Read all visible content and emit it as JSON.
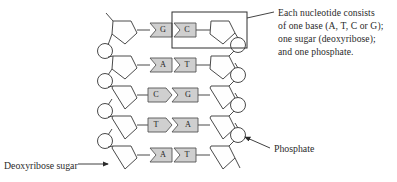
{
  "figure": {
    "type": "dna-structure-diagram",
    "background_color": "#ffffff",
    "line_color": "#3a3a3a",
    "base_fill_color": "#cfcfcf",
    "text_color": "#2a2a2a"
  },
  "callout": {
    "lines": [
      "Each nucleotide consists",
      "of one base (A, T, C or G);",
      "one sugar (deoxyribose);",
      "and one phosphate."
    ]
  },
  "labels": {
    "deoxyribose_sugar": "Deoxyribose sugar",
    "phosphate": "Phosphate"
  },
  "base_pairs": [
    {
      "left": "G",
      "right": "C",
      "left_shape": "notch-right",
      "right_shape": "point-left"
    },
    {
      "left": "A",
      "right": "T",
      "left_shape": "notch-right",
      "right_shape": "point-left"
    },
    {
      "left": "C",
      "right": "G",
      "left_shape": "point-right",
      "right_shape": "notch-left"
    },
    {
      "left": "T",
      "right": "A",
      "left_shape": "point-right",
      "right_shape": "notch-left"
    },
    {
      "left": "A",
      "right": "T",
      "left_shape": "notch-right",
      "right_shape": "point-left"
    }
  ],
  "components": {
    "sugar_shape": "pentagon",
    "phosphate_shape": "circle",
    "nucleotide_box": "rectangle-highlight"
  }
}
